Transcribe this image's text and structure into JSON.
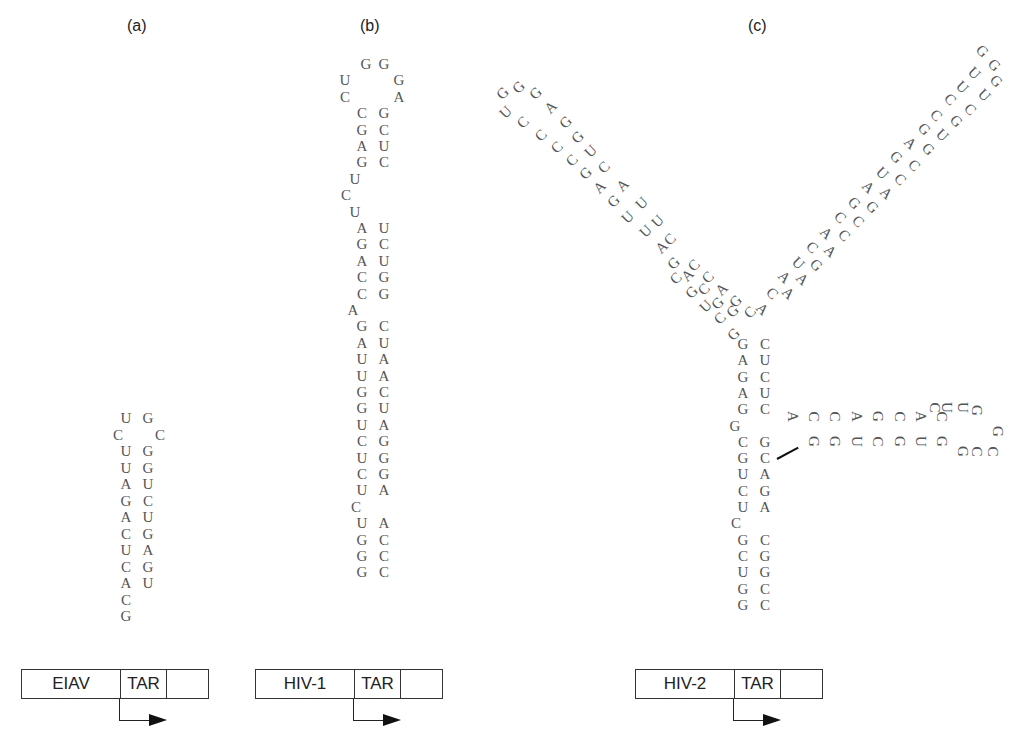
{
  "panels": [
    {
      "id": "a",
      "label": "(a)",
      "virus": "EIAV",
      "element": "TAR"
    },
    {
      "id": "b",
      "label": "(b)",
      "virus": "HIV-1",
      "element": "TAR"
    },
    {
      "id": "c",
      "label": "(c)",
      "virus": "HIV-2",
      "element": "TAR"
    }
  ],
  "eiav": {
    "loop": {
      "top": [
        "U",
        "G"
      ],
      "left": "C",
      "right": "C"
    },
    "stem_pairs": [
      [
        "U",
        "G"
      ],
      [
        "U",
        "G"
      ],
      [
        "A",
        "U"
      ],
      [
        "G",
        "C"
      ],
      [
        "A",
        "U"
      ],
      [
        "C",
        "G"
      ],
      [
        "U",
        "A"
      ],
      [
        "C",
        "G"
      ],
      [
        "A",
        "U"
      ]
    ],
    "tail": [
      "C",
      "G"
    ]
  },
  "hiv1": {
    "loop": {
      "top": [
        "G",
        "G"
      ],
      "left": [
        "U",
        "C"
      ],
      "right": [
        "G",
        "A"
      ]
    },
    "stem1_pairs": [
      [
        "C",
        "G"
      ],
      [
        "G",
        "C"
      ],
      [
        "A",
        "U"
      ],
      [
        "G",
        "C"
      ]
    ],
    "bulge1": [
      "U",
      "C",
      "U"
    ],
    "stem2_pairs": [
      [
        "A",
        "U"
      ],
      [
        "G",
        "C"
      ],
      [
        "A",
        "U"
      ],
      [
        "C",
        "G"
      ],
      [
        "C",
        "G"
      ]
    ],
    "bulge2": [
      "A"
    ],
    "stem3_pairs": [
      [
        "G",
        "C"
      ],
      [
        "A",
        "U"
      ],
      [
        "U",
        "A"
      ],
      [
        "U",
        "A"
      ],
      [
        "G",
        "C"
      ],
      [
        "G",
        "U"
      ],
      [
        "U",
        "A"
      ],
      [
        "C",
        "G"
      ],
      [
        "U",
        "G"
      ],
      [
        "C",
        "G"
      ],
      [
        "U",
        "A"
      ]
    ],
    "bulge3": [
      "C"
    ],
    "stem4_pairs": [
      [
        "U",
        "A"
      ],
      [
        "G",
        "C"
      ],
      [
        "G",
        "C"
      ],
      [
        "G",
        "C"
      ]
    ]
  },
  "hiv2": {
    "left_arm_outer": [
      "G",
      "G",
      "A",
      "G",
      "G",
      "U",
      "C",
      "U",
      "C",
      "U",
      "A",
      "C"
    ],
    "left_arm_inner": [
      "G",
      "U",
      "C",
      "C",
      "C",
      "G",
      "A",
      "G",
      "U",
      "U",
      "A",
      "G",
      "A",
      "C",
      "G",
      "G",
      "U",
      "C",
      "G"
    ],
    "left_arm_mid": [
      "C",
      "C",
      "A",
      "G",
      "C"
    ],
    "right_arm_outer": [
      "G",
      "G",
      "U",
      "C",
      "G",
      "U",
      "G",
      "C",
      "G",
      "C",
      "C",
      "A",
      "G",
      "A"
    ],
    "right_arm_inner": [
      "G",
      "U",
      "C",
      "C",
      "G",
      "G",
      "A",
      "U",
      "G",
      "C",
      "C",
      "A",
      "C",
      "A",
      "A"
    ],
    "stem_upper_pairs": [
      [
        "G",
        "C"
      ],
      [
        "A",
        "U"
      ],
      [
        "G",
        "C"
      ],
      [
        "A",
        "U"
      ],
      [
        "G",
        "C"
      ]
    ],
    "bulge_g": "G",
    "stem_mid_pairs": [
      [
        "C",
        "G"
      ],
      [
        "G",
        "C"
      ],
      [
        "U",
        "A"
      ],
      [
        "C",
        "G"
      ],
      [
        "U",
        "A"
      ]
    ],
    "bulge_c": "C",
    "stem_lower_pairs": [
      [
        "G",
        "C"
      ],
      [
        "C",
        "G"
      ],
      [
        "U",
        "G"
      ],
      [
        "G",
        "C"
      ],
      [
        "G",
        "C"
      ]
    ],
    "side_arm_top": [
      "A",
      "C",
      "C",
      "A",
      "G",
      "C",
      "A",
      "C"
    ],
    "side_arm_bottom": [
      "G",
      "G",
      "U",
      "C",
      "G",
      "U",
      "G"
    ],
    "side_loop": [
      "U",
      "U",
      "G",
      "G",
      "C",
      "C",
      "G"
    ]
  }
}
